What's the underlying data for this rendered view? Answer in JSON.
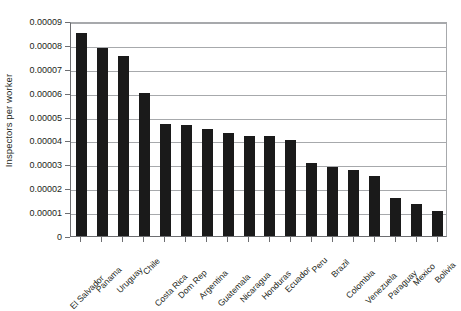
{
  "chart_data": {
    "type": "bar",
    "title": "",
    "xlabel": "",
    "ylabel": "Inspectors per worker",
    "ylim": [
      0,
      9e-05
    ],
    "ytick_labels": [
      "0.00009",
      "0.00008",
      "0.00007",
      "0.00006",
      "0.00005",
      "0.00004",
      "0.00003",
      "0.00002",
      "0.00001",
      "0"
    ],
    "ytick_values": [
      9e-05,
      8e-05,
      7e-05,
      6e-05,
      5e-05,
      4e-05,
      3e-05,
      2e-05,
      1e-05,
      0
    ],
    "grid": true,
    "legend": "none",
    "bar_color": "#1a1a1a",
    "categories": [
      "El Salvador",
      "Panama",
      "Uruguay",
      "Chile",
      "Costa Rica",
      "Dom Rep",
      "Argentina",
      "Guatemala",
      "Nicaragua",
      "Honduras",
      "Ecuador",
      "Peru",
      "Brazil",
      "Colombia",
      "Venezuela",
      "Paraguay",
      "Mexico",
      "Bolivia"
    ],
    "values": [
      8.5e-05,
      7.85e-05,
      7.55e-05,
      6e-05,
      4.7e-05,
      4.65e-05,
      4.5e-05,
      4.3e-05,
      4.2e-05,
      4.2e-05,
      4e-05,
      3.05e-05,
      2.9e-05,
      2.75e-05,
      2.5e-05,
      1.6e-05,
      1.35e-05,
      1.05e-05
    ]
  }
}
